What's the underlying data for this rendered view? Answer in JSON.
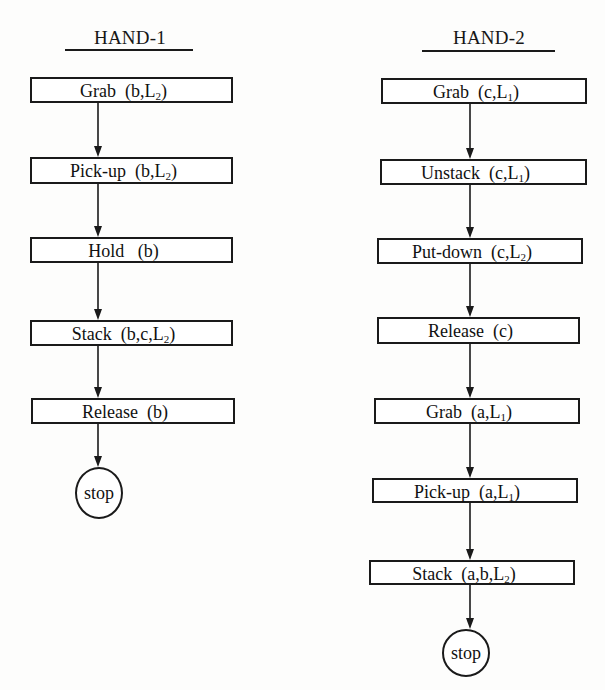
{
  "diagram": {
    "type": "dual-flowchart",
    "line_color": "#1a1a1a",
    "columns": [
      {
        "id": "hand-1",
        "title": "HAND-1",
        "title_box": {
          "x": 66,
          "y": 27,
          "w": 128
        },
        "rule": {
          "x": 65,
          "y": 49,
          "w": 128
        },
        "arrow_x": 98,
        "steps": [
          {
            "action": "Grab",
            "args": "(b,L",
            "sub": "2",
            "close": ")",
            "x": 30,
            "y": 77,
            "w": 203,
            "h": 26
          },
          {
            "action": "Pick-up",
            "args": "(b,L",
            "sub": "2",
            "close": ")",
            "x": 30,
            "y": 157,
            "w": 203,
            "h": 27
          },
          {
            "action": "Hold",
            "args": " (b)",
            "sub": "",
            "close": "",
            "x": 30,
            "y": 237,
            "w": 203,
            "h": 26
          },
          {
            "action": "Stack",
            "args": "(b,c,L",
            "sub": "2",
            "close": ")",
            "x": 30,
            "y": 320,
            "w": 203,
            "h": 26
          },
          {
            "action": "Release",
            "args": "(b)",
            "sub": "",
            "close": "",
            "x": 31,
            "y": 398,
            "w": 204,
            "h": 26
          }
        ],
        "stop": {
          "label": "stop",
          "cx": 99,
          "cy": 493,
          "rx": 24,
          "ry": 26
        }
      },
      {
        "id": "hand-2",
        "title": "HAND-2",
        "title_box": {
          "x": 423,
          "y": 27,
          "w": 132
        },
        "rule": {
          "x": 422,
          "y": 50,
          "w": 133
        },
        "arrow_x": 470,
        "steps": [
          {
            "action": "Grab",
            "args": "(c,L",
            "sub": "1",
            "close": ")",
            "x": 381,
            "y": 78,
            "w": 206,
            "h": 26
          },
          {
            "action": "Unstack",
            "args": "(c,L",
            "sub": "1",
            "close": ")",
            "x": 380,
            "y": 159,
            "w": 207,
            "h": 26
          },
          {
            "action": "Put-down",
            "args": "(c,L",
            "sub": "2",
            "close": ")",
            "x": 377,
            "y": 238,
            "w": 206,
            "h": 26
          },
          {
            "action": "Release",
            "args": "(c)",
            "sub": "",
            "close": "",
            "x": 377,
            "y": 317,
            "w": 203,
            "h": 27
          },
          {
            "action": "Grab",
            "args": "(a,L",
            "sub": "1",
            "close": ")",
            "x": 374,
            "y": 398,
            "w": 206,
            "h": 26
          },
          {
            "action": "Pick-up",
            "args": "(a,L",
            "sub": "1",
            "close": ")",
            "x": 372,
            "y": 478,
            "w": 206,
            "h": 25
          },
          {
            "action": "Stack",
            "args": "(a,b,L",
            "sub": "2",
            "close": ")",
            "x": 369,
            "y": 560,
            "w": 206,
            "h": 25
          }
        ],
        "stop": {
          "label": "stop",
          "cx": 466,
          "cy": 653,
          "rx": 24,
          "ry": 24
        }
      }
    ]
  }
}
